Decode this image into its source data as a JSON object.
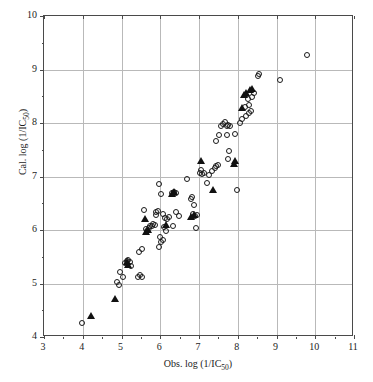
{
  "chart_data": {
    "type": "scatter",
    "title": "",
    "xlabel": "Obs. log (1/IC50)",
    "ylabel": "Cal. log (1/IC50)",
    "xlabel_html": "Obs. log (1/IC<sub>50</sub>)",
    "ylabel_html": "Cal. log (1/IC<sub>50</sub>)",
    "xlim": [
      3,
      11
    ],
    "ylim": [
      4,
      10
    ],
    "xticks": [
      3,
      4,
      5,
      6,
      7,
      8,
      9,
      10,
      11
    ],
    "yticks": [
      4,
      5,
      6,
      7,
      8,
      9,
      10
    ],
    "xtick_labels": [
      "3",
      "4",
      "5",
      "6",
      "7",
      "8",
      "9",
      "10",
      "11"
    ],
    "ytick_labels": [
      "4",
      "5",
      "6",
      "7",
      "8",
      "9",
      "10"
    ],
    "grid": true,
    "legend": "none",
    "marker_colors": {
      "open_circle": "#1a1a1a",
      "filled_triangle": "#111111",
      "gridline": "#b9b9b9",
      "frame": "#4a4a4a",
      "text": "#1c1c1c",
      "background": "#ffffff"
    },
    "series": [
      {
        "name": "training-set",
        "marker": "open-circle",
        "points": [
          [
            3.97,
            4.26
          ],
          [
            4.88,
            5.02
          ],
          [
            4.93,
            4.98
          ],
          [
            4.96,
            5.21
          ],
          [
            5.03,
            5.12
          ],
          [
            5.09,
            5.38
          ],
          [
            5.13,
            5.42
          ],
          [
            5.17,
            5.44
          ],
          [
            5.21,
            5.4
          ],
          [
            5.24,
            5.33
          ],
          [
            5.42,
            5.12
          ],
          [
            5.47,
            5.15
          ],
          [
            5.52,
            5.13
          ],
          [
            5.46,
            5.58
          ],
          [
            5.52,
            5.64
          ],
          [
            5.57,
            6.38
          ],
          [
            5.62,
            6.02
          ],
          [
            5.66,
            5.99
          ],
          [
            5.7,
            6.04
          ],
          [
            5.74,
            6.08
          ],
          [
            5.78,
            6.07
          ],
          [
            5.82,
            6.11
          ],
          [
            5.86,
            6.09
          ],
          [
            5.9,
            6.33
          ],
          [
            5.93,
            6.36
          ],
          [
            5.88,
            6.28
          ],
          [
            5.98,
            6.86
          ],
          [
            6.02,
            6.67
          ],
          [
            6.07,
            6.3
          ],
          [
            6.11,
            6.23
          ],
          [
            6.1,
            6.05
          ],
          [
            6.14,
            5.99
          ],
          [
            6.06,
            5.82
          ],
          [
            6.02,
            5.78
          ],
          [
            5.99,
            5.86
          ],
          [
            5.96,
            5.68
          ],
          [
            6.18,
            6.2
          ],
          [
            6.22,
            6.24
          ],
          [
            6.31,
            6.7
          ],
          [
            6.36,
            6.71
          ],
          [
            6.41,
            6.69
          ],
          [
            6.33,
            6.07
          ],
          [
            6.41,
            6.34
          ],
          [
            6.48,
            6.27
          ],
          [
            6.68,
            6.96
          ],
          [
            6.8,
            6.58
          ],
          [
            6.83,
            6.62
          ],
          [
            6.86,
            6.47
          ],
          [
            6.84,
            6.29
          ],
          [
            6.9,
            6.26
          ],
          [
            6.94,
            6.28
          ],
          [
            6.92,
            6.04
          ],
          [
            7.02,
            7.07
          ],
          [
            7.06,
            7.12
          ],
          [
            7.09,
            7.04
          ],
          [
            7.14,
            7.06
          ],
          [
            7.2,
            6.88
          ],
          [
            7.26,
            7.03
          ],
          [
            7.33,
            7.1
          ],
          [
            7.4,
            7.16
          ],
          [
            7.44,
            7.2
          ],
          [
            7.48,
            7.22
          ],
          [
            7.43,
            7.66
          ],
          [
            7.52,
            7.78
          ],
          [
            7.58,
            7.95
          ],
          [
            7.62,
            7.99
          ],
          [
            7.68,
            8.02
          ],
          [
            7.72,
            7.94
          ],
          [
            7.76,
            7.97
          ],
          [
            7.8,
            7.95
          ],
          [
            7.72,
            7.78
          ],
          [
            7.78,
            7.48
          ],
          [
            7.74,
            7.32
          ],
          [
            7.92,
            7.8
          ],
          [
            7.98,
            6.75
          ],
          [
            8.05,
            8.0
          ],
          [
            8.1,
            8.07
          ],
          [
            8.18,
            8.29
          ],
          [
            8.22,
            8.14
          ],
          [
            8.28,
            8.18
          ],
          [
            8.34,
            8.22
          ],
          [
            8.3,
            8.33
          ],
          [
            8.26,
            8.44
          ],
          [
            8.36,
            8.48
          ],
          [
            8.42,
            8.57
          ],
          [
            8.52,
            8.87
          ],
          [
            8.56,
            8.91
          ],
          [
            9.08,
            8.8
          ],
          [
            9.78,
            9.28
          ]
        ]
      },
      {
        "name": "test-set",
        "marker": "filled-triangle",
        "points": [
          [
            4.22,
            4.42
          ],
          [
            4.84,
            4.73
          ],
          [
            5.13,
            5.42
          ],
          [
            5.18,
            5.37
          ],
          [
            5.6,
            6.23
          ],
          [
            5.64,
            5.99
          ],
          [
            5.68,
            6.02
          ],
          [
            6.14,
            6.12
          ],
          [
            6.3,
            6.7
          ],
          [
            6.36,
            6.73
          ],
          [
            6.8,
            6.26
          ],
          [
            6.86,
            6.3
          ],
          [
            7.06,
            7.3
          ],
          [
            7.36,
            6.77
          ],
          [
            7.9,
            7.26
          ],
          [
            7.94,
            7.3
          ],
          [
            8.12,
            8.3
          ],
          [
            8.16,
            8.55
          ],
          [
            8.2,
            8.58
          ],
          [
            8.32,
            8.63
          ],
          [
            8.38,
            8.65
          ]
        ]
      }
    ]
  }
}
